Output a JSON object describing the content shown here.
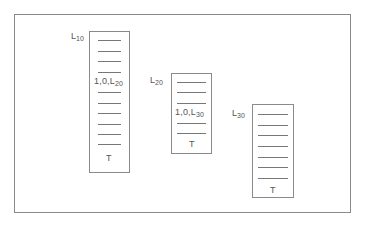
{
  "diagram": {
    "tables": [
      {
        "id": "L10",
        "label_main": "L",
        "label_sub": "10",
        "rows": 10,
        "entry": {
          "row": 4,
          "main": "1,0,L",
          "sub": "20"
        },
        "terminator": "T"
      },
      {
        "id": "L20",
        "label_main": "L",
        "label_sub": "20",
        "rows": 5,
        "entry": {
          "row": 3,
          "main": "1,0,L",
          "sub": "30"
        },
        "terminator": "T"
      },
      {
        "id": "L30",
        "label_main": "L",
        "label_sub": "30",
        "rows": 7,
        "entry": null,
        "terminator": "T"
      }
    ]
  }
}
